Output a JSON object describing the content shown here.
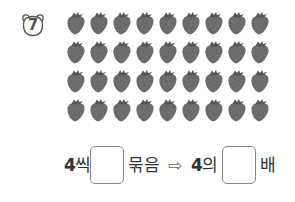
{
  "problem": {
    "number": "7",
    "badge_icon": "bear-face-icon",
    "strawberry_rows": 4,
    "strawberry_cols": 9,
    "strawberry_total": 36,
    "item_icon": "strawberry-icon"
  },
  "equation": {
    "group_size": "4",
    "group_suffix": "씩",
    "bundle_word": "묶음",
    "arrow": "⇨",
    "base": "4",
    "base_suffix": "의",
    "times_word": "배",
    "answer_box_1": "",
    "answer_box_2": ""
  }
}
